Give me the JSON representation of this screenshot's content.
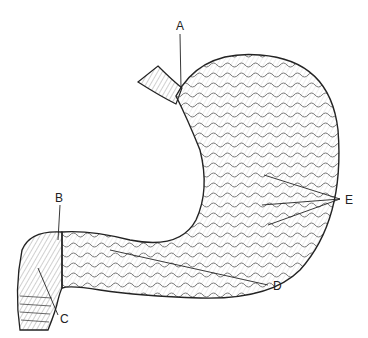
{
  "figure": {
    "labels": [
      {
        "id": "A",
        "text": "A",
        "x": 176,
        "y": 20
      },
      {
        "id": "B",
        "text": "B",
        "x": 55,
        "y": 192
      },
      {
        "id": "C",
        "text": "C",
        "x": 60,
        "y": 313
      },
      {
        "id": "D",
        "text": "D",
        "x": 273,
        "y": 280
      },
      {
        "id": "E",
        "text": "E",
        "x": 345,
        "y": 194
      }
    ]
  }
}
